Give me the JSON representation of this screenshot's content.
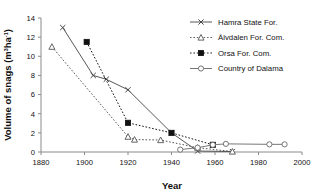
{
  "chart_data": {
    "type": "line",
    "title": "",
    "xlabel": "Year",
    "ylabel": "Volume of snags (m3ha-1)",
    "ylabel_parts": {
      "main": "Volume of snags (m",
      "sup1": "3",
      "mid": "ha",
      "sup2": "-1",
      "tail": ")"
    },
    "xlim": [
      1880,
      2000
    ],
    "ylim": [
      0,
      14
    ],
    "xticks": [
      1880,
      1900,
      1920,
      1940,
      1960,
      1980,
      2000
    ],
    "yticks": [
      0,
      2,
      4,
      6,
      8,
      10,
      12,
      14
    ],
    "grid": false,
    "legend_position": "top-right",
    "series": [
      {
        "name": "Hamra State For.",
        "marker": "cross",
        "line": "solid",
        "color": "#444444",
        "points": [
          {
            "x": 1890,
            "y": 13.0
          },
          {
            "x": 1904,
            "y": 8.0
          },
          {
            "x": 1910,
            "y": 7.6
          },
          {
            "x": 1920,
            "y": 6.5
          },
          {
            "x": 1940,
            "y": 2.0
          },
          {
            "x": 1952,
            "y": 0.1
          },
          {
            "x": 1968,
            "y": 0.05
          }
        ]
      },
      {
        "name": "Älvdalen For. Com.",
        "marker": "triangle-open",
        "line": "dotted",
        "color": "#555555",
        "points": [
          {
            "x": 1885,
            "y": 11.0
          },
          {
            "x": 1920,
            "y": 1.6
          },
          {
            "x": 1923,
            "y": 1.3
          },
          {
            "x": 1935,
            "y": 1.25
          },
          {
            "x": 1952,
            "y": 0.45
          },
          {
            "x": 1968,
            "y": 0.05
          }
        ]
      },
      {
        "name": "Orsa For. Com.",
        "marker": "square-filled",
        "line": "dotted",
        "color": "#111111",
        "points": [
          {
            "x": 1901,
            "y": 11.5
          },
          {
            "x": 1920,
            "y": 3.05
          },
          {
            "x": 1940,
            "y": 2.0
          },
          {
            "x": 1959,
            "y": 0.75
          }
        ]
      },
      {
        "name": "Country of Dalama",
        "marker": "circle-open",
        "line": "solid",
        "color": "#666666",
        "points": [
          {
            "x": 1944,
            "y": 0.25
          },
          {
            "x": 1952,
            "y": 0.45
          },
          {
            "x": 1959,
            "y": 0.75
          },
          {
            "x": 1965,
            "y": 0.85
          },
          {
            "x": 1985,
            "y": 0.8
          },
          {
            "x": 1992,
            "y": 0.8
          }
        ]
      }
    ]
  },
  "legend": {
    "entries": [
      {
        "label": "Hamra State For."
      },
      {
        "label": "Älvdalen For. Com."
      },
      {
        "label": "Orsa For. Com."
      },
      {
        "label": "Country of Dalama"
      }
    ]
  },
  "axes": {
    "x_tick_labels": [
      "1880",
      "1900",
      "1920",
      "1940",
      "1960",
      "1980",
      "2000"
    ],
    "y_tick_labels": [
      "0",
      "2",
      "4",
      "6",
      "8",
      "10",
      "12",
      "14"
    ],
    "x_title": "Year"
  },
  "colors": {
    "axis": "#888888",
    "text": "#111111",
    "series_dark": "#111111",
    "series_gray": "#666666"
  }
}
